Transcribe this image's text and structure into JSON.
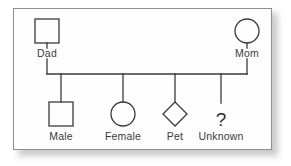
{
  "figure": {
    "kind": "genogram-family-tree",
    "frame": {
      "border_color": "#8d8f91",
      "background_color": "#fefefe",
      "shadow_color": "#b9b9b9"
    },
    "stroke_color": "#3a3a3c",
    "label_color": "#3a3a3c"
  },
  "parents": [
    {
      "id": "dad",
      "label": "Dad",
      "symbol": "square",
      "symbol_name": "male-square-symbol",
      "cx": 33,
      "cy": 22,
      "size": 24,
      "label_x": 33,
      "label_y": 38
    },
    {
      "id": "mom",
      "label": "Mom",
      "symbol": "circle",
      "symbol_name": "female-circle-symbol",
      "cx": 233,
      "cy": 22,
      "size": 24,
      "label_x": 233,
      "label_y": 38
    }
  ],
  "children": [
    {
      "id": "male",
      "label": "Male",
      "symbol": "square",
      "symbol_name": "male-square-symbol",
      "cx": 47,
      "cy": 105,
      "size": 24,
      "label_x": 47,
      "label_y": 121
    },
    {
      "id": "female",
      "label": "Female",
      "symbol": "circle",
      "symbol_name": "female-circle-symbol",
      "cx": 109,
      "cy": 105,
      "size": 24,
      "label_x": 109,
      "label_y": 121
    },
    {
      "id": "pet",
      "label": "Pet",
      "symbol": "diamond",
      "symbol_name": "pet-diamond-symbol",
      "cx": 161,
      "cy": 105,
      "size": 24,
      "label_x": 161,
      "label_y": 121
    },
    {
      "id": "unknown",
      "label": "Unknown",
      "symbol": "question-mark",
      "symbol_name": "unknown-question-mark-symbol",
      "glyph": "?",
      "cx": 207,
      "cy": 105,
      "size": 24,
      "label_x": 207,
      "label_y": 121
    }
  ],
  "connectors": {
    "dad_stem": {
      "x": 33,
      "y1": 34,
      "y2": 39
    },
    "mom_stem": {
      "x": 233,
      "y1": 34,
      "y2": 39
    },
    "dad_drop": {
      "x": 33,
      "y1": 50,
      "y2": 65
    },
    "mom_drop": {
      "x": 233,
      "y1": 50,
      "y2": 65
    },
    "sibling_bar": {
      "x1": 33,
      "x2": 233,
      "y": 65
    },
    "child_drops": [
      {
        "x": 47,
        "y1": 65,
        "y2": 93
      },
      {
        "x": 109,
        "y1": 65,
        "y2": 93
      },
      {
        "x": 161,
        "y1": 65,
        "y2": 93
      },
      {
        "x": 207,
        "y1": 65,
        "y2": 94
      }
    ]
  }
}
